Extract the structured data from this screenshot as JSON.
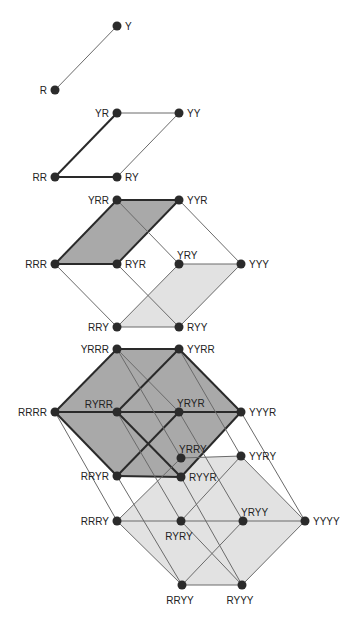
{
  "colors": {
    "background": "#ffffff",
    "node": "#2b2b2b",
    "thin_edge": "#6a6a6a",
    "thick_edge": "#2a2a2a",
    "dark_face": "#a9a9a9",
    "light_face": "#e2e2e2",
    "label": "#222222"
  },
  "diagrams": [
    {
      "name": "1-cube",
      "nodes": [
        {
          "id": "R",
          "label": "R",
          "x": 55,
          "y": 90,
          "label_side": "left"
        },
        {
          "id": "Y",
          "label": "Y",
          "x": 117,
          "y": 26,
          "label_side": "right"
        }
      ],
      "edges": [
        [
          "R",
          "Y",
          "thin"
        ]
      ]
    },
    {
      "name": "2-cube",
      "nodes": [
        {
          "id": "RR",
          "label": "RR",
          "x": 55,
          "y": 177,
          "label_side": "left"
        },
        {
          "id": "RY",
          "label": "RY",
          "x": 117,
          "y": 177,
          "label_side": "right"
        },
        {
          "id": "YR",
          "label": "YR",
          "x": 117,
          "y": 113,
          "label_side": "left"
        },
        {
          "id": "YY",
          "label": "YY",
          "x": 179,
          "y": 113,
          "label_side": "right"
        }
      ],
      "edges": [
        [
          "RR",
          "YR",
          "thick"
        ],
        [
          "RR",
          "RY",
          "thick"
        ],
        [
          "YR",
          "YY",
          "thin"
        ],
        [
          "RY",
          "YY",
          "thin"
        ]
      ]
    },
    {
      "name": "3-cube",
      "nodes": [
        {
          "id": "RRR",
          "label": "RRR",
          "x": 55,
          "y": 264,
          "label_side": "left"
        },
        {
          "id": "RYR",
          "label": "RYR",
          "x": 117,
          "y": 264,
          "label_side": "right"
        },
        {
          "id": "YRR",
          "label": "YRR",
          "x": 117,
          "y": 200,
          "label_side": "left"
        },
        {
          "id": "YYR",
          "label": "YYR",
          "x": 179,
          "y": 200,
          "label_side": "right"
        },
        {
          "id": "RRY",
          "label": "RRY",
          "x": 117,
          "y": 327,
          "label_side": "left"
        },
        {
          "id": "RYY",
          "label": "RYY",
          "x": 179,
          "y": 327,
          "label_side": "right"
        },
        {
          "id": "YRY",
          "label": "YRY",
          "x": 179,
          "y": 264,
          "label_side": "top"
        },
        {
          "id": "YYY",
          "label": "YYY",
          "x": 241,
          "y": 264,
          "label_side": "right"
        }
      ],
      "faces": [
        {
          "nodes": [
            "RRR",
            "YRR",
            "YYR",
            "RYR"
          ],
          "shade": "dark"
        },
        {
          "nodes": [
            "RRY",
            "YRY",
            "YYY",
            "RYY"
          ],
          "shade": "light"
        }
      ],
      "edges": [
        [
          "RRR",
          "YRR",
          "thick"
        ],
        [
          "YRR",
          "YYR",
          "thick"
        ],
        [
          "YYR",
          "RYR",
          "thick"
        ],
        [
          "RYR",
          "RRR",
          "thick"
        ],
        [
          "RRY",
          "YRY",
          "thin"
        ],
        [
          "YRY",
          "YYY",
          "thin"
        ],
        [
          "YYY",
          "RYY",
          "thin"
        ],
        [
          "RYY",
          "RRY",
          "thin"
        ],
        [
          "RRR",
          "RRY",
          "thin"
        ],
        [
          "YRR",
          "YRY",
          "thin"
        ],
        [
          "YYR",
          "YYY",
          "thin"
        ],
        [
          "RYR",
          "RYY",
          "thin"
        ]
      ]
    },
    {
      "name": "4-cube",
      "nodes": [
        {
          "id": "RRRR",
          "label": "RRRR",
          "x": 55,
          "y": 412,
          "label_side": "left"
        },
        {
          "id": "YRRR",
          "label": "YRRR",
          "x": 117,
          "y": 349,
          "label_side": "left"
        },
        {
          "id": "RYRR",
          "label": "RYRR",
          "x": 117,
          "y": 412,
          "label_side": "top-left"
        },
        {
          "id": "YYRR",
          "label": "YYRR",
          "x": 179,
          "y": 349,
          "label_side": "right"
        },
        {
          "id": "RRYR",
          "label": "RRYR",
          "x": 117,
          "y": 476,
          "label_side": "left"
        },
        {
          "id": "YRYR",
          "label": "YRYR",
          "x": 179,
          "y": 412,
          "label_side": "top"
        },
        {
          "id": "RYYR",
          "label": "RYYR",
          "x": 181,
          "y": 477,
          "label_side": "right"
        },
        {
          "id": "YYYR",
          "label": "YYYR",
          "x": 241,
          "y": 412,
          "label_side": "right"
        },
        {
          "id": "RRRY",
          "label": "RRRY",
          "x": 117,
          "y": 521,
          "label_side": "left"
        },
        {
          "id": "YRRY",
          "label": "YRRY",
          "x": 181,
          "y": 458,
          "label_side": "top"
        },
        {
          "id": "RYRY",
          "label": "RYRY",
          "x": 181,
          "y": 521,
          "label_side": "bottom"
        },
        {
          "id": "YYRY",
          "label": "YYRY",
          "x": 241,
          "y": 456,
          "label_side": "right"
        },
        {
          "id": "RRYY",
          "label": "RRYY",
          "x": 182,
          "y": 585,
          "label_side": "bottom"
        },
        {
          "id": "YRYY",
          "label": "YRYY",
          "x": 243,
          "y": 521,
          "label_side": "top"
        },
        {
          "id": "RYYY",
          "label": "RYYY",
          "x": 242,
          "y": 585,
          "label_side": "bottom"
        },
        {
          "id": "YYYY",
          "label": "YYYY",
          "x": 305,
          "y": 521,
          "label_side": "right"
        }
      ],
      "faces": [
        {
          "nodes": [
            "RRRY",
            "YRRY",
            "YYRY",
            "YYYY",
            "RYYY",
            "RRYY"
          ],
          "shade": "light"
        },
        {
          "nodes": [
            "RRRR",
            "YRRR",
            "YYRR",
            "YYYR",
            "RYYR",
            "RRYR"
          ],
          "shade": "dark"
        }
      ],
      "edges": [
        [
          "RRRR",
          "YRRR",
          "thick"
        ],
        [
          "YRRR",
          "YYRR",
          "thick"
        ],
        [
          "YYRR",
          "YYYR",
          "thick"
        ],
        [
          "YYYR",
          "RYYR",
          "thick"
        ],
        [
          "RYYR",
          "RRYR",
          "thick"
        ],
        [
          "RRYR",
          "RRRR",
          "thick"
        ],
        [
          "RRRR",
          "RYRR",
          "thick"
        ],
        [
          "RYRR",
          "YRYR",
          "thick"
        ],
        [
          "YRYR",
          "YYYR",
          "thick"
        ],
        [
          "YRRR",
          "YRYR",
          "thin"
        ],
        [
          "RYRR",
          "RYYR",
          "thick"
        ],
        [
          "YYRR",
          "RYRR",
          "thick"
        ],
        [
          "YRYR",
          "RRYR",
          "thick"
        ],
        [
          "RRRY",
          "YRRY",
          "thin"
        ],
        [
          "YRRY",
          "YYRY",
          "thin"
        ],
        [
          "YYRY",
          "YYYY",
          "thin"
        ],
        [
          "YYYY",
          "RYYY",
          "thin"
        ],
        [
          "RYYY",
          "RRYY",
          "thin"
        ],
        [
          "RRYY",
          "RRRY",
          "thin"
        ],
        [
          "RRRY",
          "RYRY",
          "thin"
        ],
        [
          "RYRY",
          "YRYY",
          "thin"
        ],
        [
          "YRYY",
          "YYYY",
          "thin"
        ],
        [
          "RYRY",
          "RYYY",
          "thin"
        ],
        [
          "YYRY",
          "RYRY",
          "thin"
        ],
        [
          "YRYY",
          "RRYY",
          "thin"
        ],
        [
          "RRRR",
          "RRRY",
          "thin"
        ],
        [
          "YRRR",
          "YRRY",
          "thin"
        ],
        [
          "RYRR",
          "RYRY",
          "thin"
        ],
        [
          "YYRR",
          "YYRY",
          "thin"
        ],
        [
          "RRYR",
          "RRYY",
          "thin"
        ],
        [
          "YRYR",
          "YRYY",
          "thin"
        ],
        [
          "RYYR",
          "RYYY",
          "thin"
        ],
        [
          "YYYR",
          "YYYY",
          "thin"
        ]
      ]
    }
  ]
}
